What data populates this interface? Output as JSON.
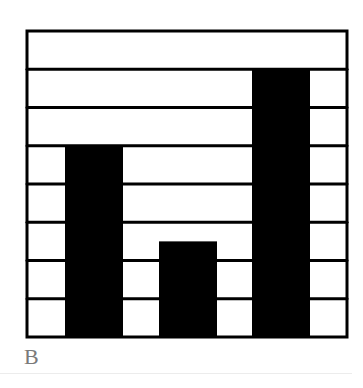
{
  "chart_data": {
    "type": "bar",
    "title": "",
    "xlabel": "",
    "ylabel": "",
    "categories": [
      "1",
      "2",
      "3"
    ],
    "values": [
      5,
      2.5,
      7
    ],
    "ylim": [
      0,
      8
    ],
    "grid": true,
    "grid_rows": 8,
    "bar_color": "#000000",
    "legend": null
  },
  "panel_label": "B"
}
